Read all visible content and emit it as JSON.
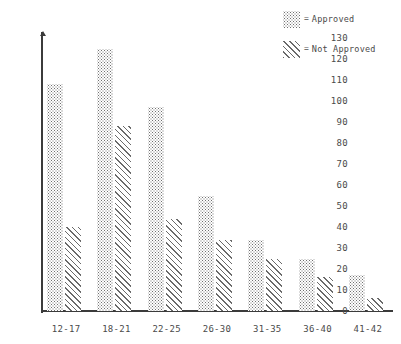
{
  "legend": {
    "position": "top-right",
    "equals_sign": "=",
    "entries": [
      {
        "label": "Approved",
        "pattern": "dots",
        "swatch_name": "legend-swatch-approved"
      },
      {
        "label": "Not Approved",
        "pattern": "hatch",
        "swatch_name": "legend-swatch-not-approved"
      }
    ]
  },
  "chart_data": {
    "type": "bar",
    "title": "",
    "subtitle": "",
    "xlabel": "",
    "ylabel": "",
    "grid": false,
    "legend_position": "top-right",
    "ylim": [
      0,
      135
    ],
    "ytick_step": 10,
    "yticks": [
      130,
      120,
      110,
      100,
      90,
      80,
      70,
      60,
      50,
      40,
      30,
      20,
      10,
      0
    ],
    "categories": [
      "12-17",
      "18-21",
      "22-25",
      "26-30",
      "31-35",
      "36-40",
      "41-42"
    ],
    "series": [
      {
        "name": "Approved",
        "pattern": "dots",
        "values": [
          108,
          125,
          97,
          55,
          34,
          25,
          17
        ]
      },
      {
        "name": "Not Approved",
        "pattern": "hatch",
        "values": [
          40,
          88,
          44,
          34,
          25,
          16,
          6
        ]
      }
    ]
  }
}
